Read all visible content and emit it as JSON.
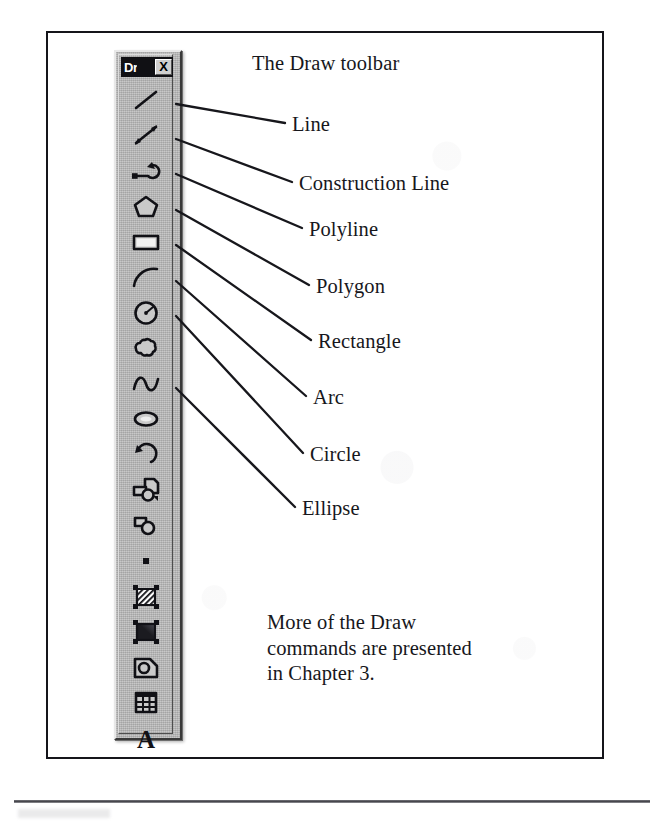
{
  "figure": {
    "heading": "The Draw toolbar",
    "note_lines": [
      "More of the Draw",
      "commands are presented",
      "in Chapter 3."
    ]
  },
  "toolbar": {
    "title": "Dr",
    "close_label": "X",
    "background_color": "#b4b4b4",
    "titlebar_color": "#101014",
    "buttons": [
      {
        "name": "line",
        "icon": "line-icon"
      },
      {
        "name": "construction-line",
        "icon": "construction-line-icon"
      },
      {
        "name": "polyline",
        "icon": "polyline-icon"
      },
      {
        "name": "polygon",
        "icon": "polygon-icon"
      },
      {
        "name": "rectangle",
        "icon": "rectangle-icon"
      },
      {
        "name": "arc",
        "icon": "arc-icon"
      },
      {
        "name": "circle",
        "icon": "circle-icon"
      },
      {
        "name": "revision-cloud",
        "icon": "revision-cloud-icon"
      },
      {
        "name": "spline",
        "icon": "spline-icon"
      },
      {
        "name": "ellipse",
        "icon": "ellipse-icon"
      },
      {
        "name": "ellipse-arc",
        "icon": "ellipse-arc-icon"
      },
      {
        "name": "insert-block",
        "icon": "insert-block-icon"
      },
      {
        "name": "make-block",
        "icon": "make-block-icon"
      },
      {
        "name": "point",
        "icon": "point-icon"
      },
      {
        "name": "hatch",
        "icon": "hatch-icon"
      },
      {
        "name": "gradient",
        "icon": "gradient-icon"
      },
      {
        "name": "region",
        "icon": "region-icon"
      },
      {
        "name": "table",
        "icon": "table-icon"
      },
      {
        "name": "multiline-text",
        "icon": "text-icon"
      }
    ]
  },
  "callouts": [
    {
      "label": "Line",
      "label_x": 292,
      "label_y": 113,
      "leader_x1": 176,
      "leader_y1": 104,
      "leader_x2": 285,
      "leader_y2": 123
    },
    {
      "label": "Construction Line",
      "label_x": 299,
      "label_y": 172,
      "leader_x1": 176,
      "leader_y1": 139,
      "leader_x2": 292,
      "leader_y2": 182
    },
    {
      "label": "Polyline",
      "label_x": 309,
      "label_y": 218,
      "leader_x1": 176,
      "leader_y1": 174,
      "leader_x2": 302,
      "leader_y2": 228
    },
    {
      "label": "Polygon",
      "label_x": 316,
      "label_y": 275,
      "leader_x1": 176,
      "leader_y1": 210,
      "leader_x2": 309,
      "leader_y2": 285
    },
    {
      "label": "Rectangle",
      "label_x": 318,
      "label_y": 330,
      "leader_x1": 176,
      "leader_y1": 245,
      "leader_x2": 311,
      "leader_y2": 340
    },
    {
      "label": "Arc",
      "label_x": 313,
      "label_y": 386,
      "leader_x1": 176,
      "leader_y1": 281,
      "leader_x2": 306,
      "leader_y2": 396
    },
    {
      "label": "Circle",
      "label_x": 310,
      "label_y": 443,
      "leader_x1": 176,
      "leader_y1": 316,
      "leader_y2": 453,
      "leader_x2": 303
    },
    {
      "label": "Ellipse",
      "label_x": 302,
      "label_y": 497,
      "leader_x1": 176,
      "leader_y1": 388,
      "leader_x2": 295,
      "leader_y2": 507
    }
  ]
}
